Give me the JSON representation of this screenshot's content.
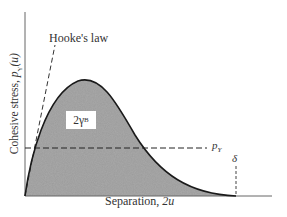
{
  "figure": {
    "type": "cohesive-stress-curve",
    "annotations": {
      "hookes_law": "Hooke's law",
      "area_label_main": "2γ",
      "area_label_sub": "B",
      "yield_stress_main": "p",
      "yield_stress_sub": "Y",
      "delta": "δ"
    },
    "axes": {
      "x_label_text": "Separation, ",
      "x_label_var": "2u",
      "y_label_text": "Cohesive stress, ",
      "y_label_var": "p",
      "y_label_sub": "Y",
      "y_label_arg": "(u)"
    },
    "colors": {
      "fill": "#9a9a9a",
      "curve": "#1a1a1a",
      "axis": "#555555",
      "dash": "#333333"
    }
  }
}
